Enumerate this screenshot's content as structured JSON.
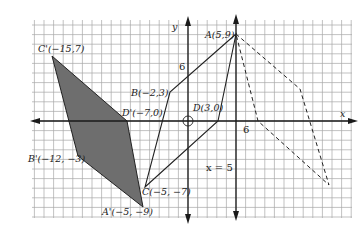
{
  "diagram": {
    "type": "coordinate-plane-transformation",
    "axes": {
      "x_label": "x",
      "y_label": "y",
      "tick_label_x": "6",
      "tick_label_y": "6",
      "origin_marker": "circle-at-origin"
    },
    "reflection_line": {
      "label": "x = 5",
      "style": "solid-arrow-vertical"
    },
    "figures": {
      "original": {
        "style": "solid",
        "vertices": [
          {
            "name": "A",
            "label": "A(5,9)",
            "x": 5,
            "y": 9
          },
          {
            "name": "B",
            "label": "B(−2,3)",
            "x": -2,
            "y": 3
          },
          {
            "name": "C",
            "label": "C(−5, −7)",
            "x": -5,
            "y": -7
          },
          {
            "name": "D",
            "label": "D(3,0)",
            "x": 3,
            "y": 0
          }
        ]
      },
      "image": {
        "style": "shaded",
        "vertices": [
          {
            "name": "A'",
            "label": "A'(−5, −9)",
            "x": -5,
            "y": -9
          },
          {
            "name": "B'",
            "label": "B'(−12, −3)",
            "x": -12,
            "y": -3
          },
          {
            "name": "C'",
            "label": "C'(−15,7)",
            "x": -15,
            "y": 7
          },
          {
            "name": "D'",
            "label": "D'(−7,0)",
            "x": -7,
            "y": 0
          }
        ]
      },
      "reflected": {
        "style": "dashed",
        "vertices_unlabeled": 4
      }
    },
    "colors": {
      "grid": "#9a9a9a",
      "axes": "#1a1a1a",
      "shaded_fill": "#6e6e6e",
      "line": "#222222"
    }
  }
}
